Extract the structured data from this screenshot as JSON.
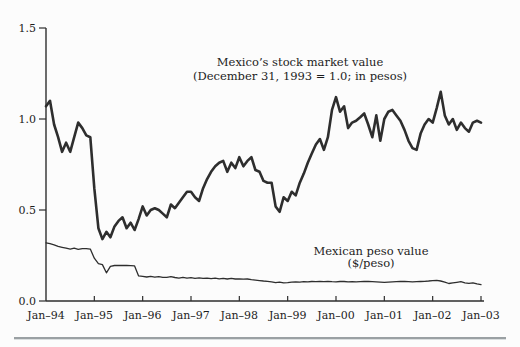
{
  "colors": {
    "line": "#2e2e2e",
    "text": "#1c1c1c",
    "rule_dark": "#9aa0a3",
    "rule_light": "#dadedf",
    "background": "#fcfcfc"
  },
  "chart_data": {
    "type": "line",
    "title": "",
    "xlabel": "",
    "ylabel": "",
    "grid": false,
    "ylim": [
      0.0,
      1.5
    ],
    "y_tick_values": [
      0.0,
      0.5,
      1.0,
      1.5
    ],
    "y_tick_labels": [
      "0.0",
      "0.5",
      "1.0",
      "1.5"
    ],
    "x_tick_labels": [
      "Jan–94",
      "Jan–95",
      "Jan–96",
      "Jan–97",
      "Jan–98",
      "Jan–99",
      "Jan–00",
      "Jan–01",
      "Jan–02",
      "Jan–03"
    ],
    "x_unit": "month",
    "x_start": "Jan-1994",
    "x_end": "Jan-2003",
    "series": [
      {
        "name": "stock-market",
        "annotation_lines": [
          "Mexico’s stock market value",
          "(December 31, 1993 = 1.0; in pesos)"
        ],
        "line_width": 2.6,
        "values": [
          1.07,
          1.1,
          0.97,
          0.9,
          0.82,
          0.87,
          0.82,
          0.9,
          0.98,
          0.95,
          0.91,
          0.9,
          0.62,
          0.4,
          0.34,
          0.38,
          0.35,
          0.41,
          0.44,
          0.46,
          0.4,
          0.43,
          0.39,
          0.45,
          0.52,
          0.47,
          0.5,
          0.51,
          0.5,
          0.48,
          0.46,
          0.53,
          0.51,
          0.54,
          0.57,
          0.6,
          0.6,
          0.57,
          0.55,
          0.62,
          0.67,
          0.71,
          0.74,
          0.76,
          0.77,
          0.71,
          0.76,
          0.73,
          0.79,
          0.74,
          0.77,
          0.79,
          0.72,
          0.71,
          0.66,
          0.65,
          0.65,
          0.52,
          0.49,
          0.57,
          0.55,
          0.6,
          0.58,
          0.65,
          0.7,
          0.76,
          0.81,
          0.86,
          0.89,
          0.83,
          0.9,
          1.05,
          1.12,
          1.04,
          1.07,
          0.95,
          0.98,
          0.99,
          1.01,
          1.03,
          0.97,
          0.9,
          1.02,
          0.88,
          1.0,
          1.04,
          1.05,
          1.02,
          0.99,
          0.94,
          0.88,
          0.84,
          0.83,
          0.92,
          0.97,
          1.0,
          0.98,
          1.06,
          1.15,
          1.02,
          0.97,
          1.0,
          0.94,
          0.98,
          0.95,
          0.93,
          0.98,
          0.99,
          0.98
        ]
      },
      {
        "name": "peso",
        "annotation_lines": [
          "Mexican peso value",
          "($/peso)"
        ],
        "line_width": 1.3,
        "values": [
          0.32,
          0.315,
          0.308,
          0.3,
          0.295,
          0.29,
          0.285,
          0.29,
          0.284,
          0.288,
          0.288,
          0.285,
          0.235,
          0.205,
          0.2,
          0.155,
          0.19,
          0.195,
          0.196,
          0.195,
          0.195,
          0.194,
          0.193,
          0.138,
          0.135,
          0.132,
          0.135,
          0.131,
          0.134,
          0.13,
          0.13,
          0.134,
          0.129,
          0.126,
          0.13,
          0.126,
          0.128,
          0.125,
          0.127,
          0.124,
          0.126,
          0.123,
          0.126,
          0.122,
          0.125,
          0.121,
          0.124,
          0.121,
          0.122,
          0.12,
          0.121,
          0.117,
          0.115,
          0.112,
          0.11,
          0.108,
          0.105,
          0.101,
          0.104,
          0.1,
          0.101,
          0.104,
          0.105,
          0.104,
          0.106,
          0.105,
          0.107,
          0.106,
          0.107,
          0.106,
          0.108,
          0.106,
          0.105,
          0.107,
          0.107,
          0.105,
          0.106,
          0.105,
          0.106,
          0.107,
          0.107,
          0.106,
          0.105,
          0.104,
          0.103,
          0.104,
          0.105,
          0.106,
          0.107,
          0.107,
          0.106,
          0.105,
          0.106,
          0.107,
          0.108,
          0.11,
          0.112,
          0.114,
          0.11,
          0.104,
          0.096,
          0.1,
          0.103,
          0.106,
          0.1,
          0.097,
          0.1,
          0.094,
          0.09
        ]
      }
    ]
  }
}
